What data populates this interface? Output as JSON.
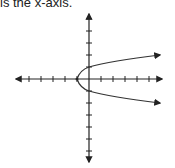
{
  "caption": "is the x-axis.",
  "diagram": {
    "type": "coordinate-plane",
    "curve": "parabola opening right",
    "vertex": [
      -1,
      0
    ],
    "x_ticks": [
      -6,
      -5,
      -4,
      -3,
      -2,
      -1,
      1,
      2,
      3,
      4,
      5,
      6
    ],
    "y_ticks": [
      -6,
      -5,
      -4,
      -3,
      -2,
      -1,
      1,
      2,
      3,
      4,
      5,
      6
    ],
    "axis_color": "#222222",
    "curve_color": "#333333"
  }
}
